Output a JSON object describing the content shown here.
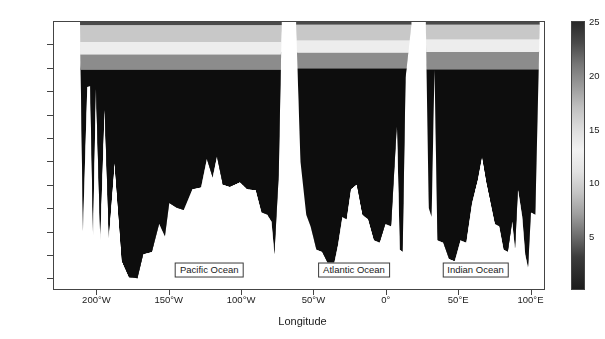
{
  "chart_data": {
    "type": "area",
    "title": "",
    "subtitle": "",
    "xlabel": "Longitude",
    "ylabel": "",
    "xlim": [
      -230,
      110
    ],
    "ylim": [
      -5750,
      0
    ],
    "grid": false,
    "legend_position": "right-colorbar",
    "xticks": [
      {
        "value": -200,
        "label": "200°W"
      },
      {
        "value": -150,
        "label": "150°W"
      },
      {
        "value": -100,
        "label": "100°W"
      },
      {
        "value": -50,
        "label": "50°W"
      },
      {
        "value": 0,
        "label": "0°"
      },
      {
        "value": 50,
        "label": "50°E"
      },
      {
        "value": 100,
        "label": "100°E"
      }
    ],
    "yticks": [
      {
        "value": -500,
        "label": "–500 m"
      },
      {
        "value": -1000,
        "label": "–1000 m"
      },
      {
        "value": -1500,
        "label": "–1500 m"
      },
      {
        "value": -2000,
        "label": "–2000 m"
      },
      {
        "value": -2500,
        "label": "–2500 m"
      },
      {
        "value": -3000,
        "label": "–3000 m"
      },
      {
        "value": -3500,
        "label": "–3500 m"
      },
      {
        "value": -4000,
        "label": "–4000 m"
      },
      {
        "value": -4500,
        "label": "–4500 m"
      },
      {
        "value": -5000,
        "label": "–5000 m"
      },
      {
        "value": -5500,
        "label": "–5500 m"
      }
    ],
    "colorbar": {
      "vmin": 0,
      "vmax": 25,
      "ticks": [
        5,
        10,
        15,
        20,
        25
      ],
      "tick_labels": [
        "5",
        "10",
        "15",
        "20",
        "25"
      ],
      "colormap": "grayscale-cyclic-dark-light-dark",
      "stops": [
        {
          "value": 25,
          "color": "#2a2a2a"
        },
        {
          "value": 23,
          "color": "#4a4a4a"
        },
        {
          "value": 21,
          "color": "#777777"
        },
        {
          "value": 19,
          "color": "#9a9a9a"
        },
        {
          "value": 17,
          "color": "#c0c0c0"
        },
        {
          "value": 15,
          "color": "#dcdcdc"
        },
        {
          "value": 13,
          "color": "#f2f2f2"
        },
        {
          "value": 11,
          "color": "#e2e2e2"
        },
        {
          "value": 9,
          "color": "#c4c4c4"
        },
        {
          "value": 7,
          "color": "#9e9e9e"
        },
        {
          "value": 5,
          "color": "#6e6e6e"
        },
        {
          "value": 3,
          "color": "#3c3c3c"
        },
        {
          "value": 0,
          "color": "#1c1c1c"
        }
      ]
    },
    "annotations": [
      {
        "text": "Pacific Ocean",
        "x": -122,
        "y": -5320,
        "boxed": true
      },
      {
        "text": "Atlantic Ocean",
        "x": -22,
        "y": -5320,
        "boxed": true
      },
      {
        "text": "Indian Ocean",
        "x": 62,
        "y": -5320,
        "boxed": true
      }
    ],
    "basins": [
      {
        "name": "Pacific Ocean",
        "x_start": -212,
        "x_end": -72,
        "water_layers": [
          {
            "label": "surface warm layer",
            "value": 24,
            "color": "#4a4a4a",
            "top_depth": 0,
            "bottom_depth": -70
          },
          {
            "label": "upper thermocline",
            "value": 17,
            "color": "#c8c8c8",
            "top_depth": -70,
            "bottom_depth": -430
          },
          {
            "label": "lower thermocline",
            "value": 13,
            "color": "#ededed",
            "top_depth": -430,
            "bottom_depth": -700
          },
          {
            "label": "intermediate water",
            "value": 9,
            "color": "#8c8c8c",
            "top_depth": -700,
            "bottom_depth": -1030
          },
          {
            "label": "deep water",
            "value": 2,
            "color": "#0d0d0d",
            "top_depth": -1030,
            "bottom_depth": -5600
          }
        ],
        "seafloor_profile": [
          {
            "x": -212,
            "depth": -120
          },
          {
            "x": -210,
            "depth": -4500
          },
          {
            "x": -207,
            "depth": -1400
          },
          {
            "x": -205,
            "depth": -1380
          },
          {
            "x": -203,
            "depth": -4600
          },
          {
            "x": -201,
            "depth": -1450
          },
          {
            "x": -198,
            "depth": -4700
          },
          {
            "x": -195,
            "depth": -1900
          },
          {
            "x": -192,
            "depth": -4650
          },
          {
            "x": -188,
            "depth": -3050
          },
          {
            "x": -183,
            "depth": -5150
          },
          {
            "x": -178,
            "depth": -5500
          },
          {
            "x": -172,
            "depth": -5520
          },
          {
            "x": -168,
            "depth": -5000
          },
          {
            "x": -162,
            "depth": -4950
          },
          {
            "x": -157,
            "depth": -4350
          },
          {
            "x": -153,
            "depth": -4620
          },
          {
            "x": -150,
            "depth": -3900
          },
          {
            "x": -145,
            "depth": -4000
          },
          {
            "x": -140,
            "depth": -4050
          },
          {
            "x": -134,
            "depth": -3600
          },
          {
            "x": -128,
            "depth": -3560
          },
          {
            "x": -124,
            "depth": -2950
          },
          {
            "x": -120,
            "depth": -3350
          },
          {
            "x": -117,
            "depth": -2900
          },
          {
            "x": -113,
            "depth": -3500
          },
          {
            "x": -108,
            "depth": -3550
          },
          {
            "x": -101,
            "depth": -3450
          },
          {
            "x": -96,
            "depth": -3600
          },
          {
            "x": -90,
            "depth": -3620
          },
          {
            "x": -86,
            "depth": -4100
          },
          {
            "x": -82,
            "depth": -4150
          },
          {
            "x": -79,
            "depth": -4300
          },
          {
            "x": -77,
            "depth": -5000
          },
          {
            "x": -74,
            "depth": -3300
          },
          {
            "x": -72,
            "depth": -100
          }
        ]
      },
      {
        "name": "Atlantic Ocean",
        "x_start": -62,
        "x_end": 18,
        "water_layers": [
          {
            "label": "surface warm layer",
            "value": 24,
            "color": "#4a4a4a",
            "top_depth": 0,
            "bottom_depth": -60
          },
          {
            "label": "upper thermocline",
            "value": 17,
            "color": "#c8c8c8",
            "top_depth": -60,
            "bottom_depth": -400
          },
          {
            "label": "lower thermocline",
            "value": 13,
            "color": "#ededed",
            "top_depth": -400,
            "bottom_depth": -660
          },
          {
            "label": "intermediate water",
            "value": 9,
            "color": "#8c8c8c",
            "top_depth": -660,
            "bottom_depth": -1000
          },
          {
            "label": "deep water",
            "value": 2,
            "color": "#0d0d0d",
            "top_depth": -1000,
            "bottom_depth": -5600
          }
        ],
        "seafloor_profile": [
          {
            "x": -62,
            "depth": -80
          },
          {
            "x": -59,
            "depth": -3000
          },
          {
            "x": -55,
            "depth": -4150
          },
          {
            "x": -52,
            "depth": -4400
          },
          {
            "x": -48,
            "depth": -4900
          },
          {
            "x": -44,
            "depth": -4950
          },
          {
            "x": -40,
            "depth": -5200
          },
          {
            "x": -36,
            "depth": -5250
          },
          {
            "x": -33,
            "depth": -4800
          },
          {
            "x": -30,
            "depth": -4200
          },
          {
            "x": -27,
            "depth": -4250
          },
          {
            "x": -24,
            "depth": -3600
          },
          {
            "x": -20,
            "depth": -3500
          },
          {
            "x": -16,
            "depth": -4150
          },
          {
            "x": -12,
            "depth": -4250
          },
          {
            "x": -8,
            "depth": -4700
          },
          {
            "x": -4,
            "depth": -4750
          },
          {
            "x": 0,
            "depth": -4350
          },
          {
            "x": 4,
            "depth": -4400
          },
          {
            "x": 8,
            "depth": -2200
          },
          {
            "x": 10,
            "depth": -4900
          },
          {
            "x": 12,
            "depth": -4950
          },
          {
            "x": 14,
            "depth": -1200
          },
          {
            "x": 18,
            "depth": -60
          }
        ]
      },
      {
        "name": "Indian Ocean",
        "x_start": 28,
        "x_end": 107,
        "water_layers": [
          {
            "label": "surface warm layer",
            "value": 24,
            "color": "#4a4a4a",
            "top_depth": 0,
            "bottom_depth": -60
          },
          {
            "label": "upper thermocline",
            "value": 17,
            "color": "#c8c8c8",
            "top_depth": -60,
            "bottom_depth": -380
          },
          {
            "label": "lower thermocline",
            "value": 13,
            "color": "#ededed",
            "top_depth": -380,
            "bottom_depth": -640
          },
          {
            "label": "intermediate water",
            "value": 9,
            "color": "#8c8c8c",
            "top_depth": -640,
            "bottom_depth": -1020
          },
          {
            "label": "deep water",
            "value": 2,
            "color": "#0d0d0d",
            "top_depth": -1020,
            "bottom_depth": -5600
          }
        ],
        "seafloor_profile": [
          {
            "x": 28,
            "depth": -120
          },
          {
            "x": 30,
            "depth": -4000
          },
          {
            "x": 32,
            "depth": -4200
          },
          {
            "x": 34,
            "depth": -1000
          },
          {
            "x": 36,
            "depth": -4700
          },
          {
            "x": 40,
            "depth": -4750
          },
          {
            "x": 44,
            "depth": -5100
          },
          {
            "x": 48,
            "depth": -5150
          },
          {
            "x": 52,
            "depth": -4700
          },
          {
            "x": 56,
            "depth": -4750
          },
          {
            "x": 60,
            "depth": -3900
          },
          {
            "x": 64,
            "depth": -3400
          },
          {
            "x": 67,
            "depth": -2900
          },
          {
            "x": 70,
            "depth": -3450
          },
          {
            "x": 73,
            "depth": -3900
          },
          {
            "x": 76,
            "depth": -4350
          },
          {
            "x": 79,
            "depth": -4400
          },
          {
            "x": 82,
            "depth": -4900
          },
          {
            "x": 85,
            "depth": -4950
          },
          {
            "x": 88,
            "depth": -4300
          },
          {
            "x": 90,
            "depth": -4900
          },
          {
            "x": 92,
            "depth": -3600
          },
          {
            "x": 95,
            "depth": -4200
          },
          {
            "x": 97,
            "depth": -5000
          },
          {
            "x": 99,
            "depth": -5300
          },
          {
            "x": 101,
            "depth": -4100
          },
          {
            "x": 104,
            "depth": -4150
          },
          {
            "x": 107,
            "depth": -100
          }
        ]
      }
    ],
    "landmasses": [
      {
        "label": "Australia / west gap",
        "x_start": -230,
        "x_end": -212
      },
      {
        "label": "South America",
        "x_start": -72,
        "x_end": -62
      },
      {
        "label": "Africa",
        "x_start": 18,
        "x_end": 28
      },
      {
        "label": "east gap",
        "x_start": 107,
        "x_end": 110
      }
    ]
  },
  "axis": {
    "x_title": "Longitude"
  }
}
